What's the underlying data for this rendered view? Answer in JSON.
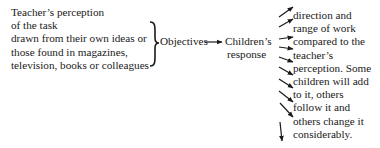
{
  "diagram": {
    "source": {
      "lines": [
        "Teacher’s perception",
        "of the task",
        "drawn from their own ideas or",
        "those found in magazines,",
        "television, books or colleagues"
      ]
    },
    "objectives_label": "Objectives",
    "children_label": {
      "lines": [
        "Children’s",
        "response"
      ]
    },
    "response_description": {
      "lines": [
        "direction and",
        "range of work",
        "compared to the",
        "teacher’s",
        "perception. Some",
        "children will add",
        "to it, others",
        "follow it and",
        "others change it",
        "considerably."
      ]
    },
    "connectors": {
      "brace": "right-curly-brace",
      "main_arrow": "right-arrow",
      "fan_arrows_count": 10
    },
    "colors": {
      "ink": "#1a1a1a",
      "background": "#ffffff"
    }
  }
}
